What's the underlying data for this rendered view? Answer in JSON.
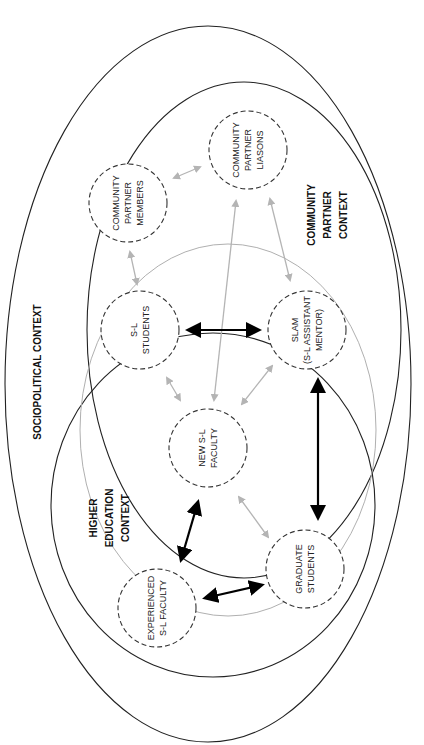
{
  "diagram": {
    "orientation": "rotated-90-clockwise",
    "colors": {
      "background": "#ffffff",
      "context_line": "#222222",
      "overlap_line": "#b0b0b0",
      "node_border": "#333333",
      "strong_arrow": "#000000",
      "weak_arrow": "#b4b4b4"
    },
    "contexts": {
      "sociopolitical": {
        "label": "SOCIOPOLITICAL CONTEXT"
      },
      "higher_education": {
        "lines": [
          "HIGHER",
          "EDUCATION",
          "CONTEXT"
        ]
      },
      "community_partner": {
        "lines": [
          "COMMUNITY",
          "PARTNER",
          "CONTEXT"
        ]
      }
    },
    "nodes": {
      "community_partner_members": {
        "lines": [
          "COMMUNITY",
          "PARTNER",
          "MEMBERS"
        ]
      },
      "community_partner_liasons": {
        "lines": [
          "COMMUNITY",
          "PARTNER",
          "LIASONS"
        ]
      },
      "sl_students": {
        "lines": [
          "S-L",
          "STUDENTS"
        ]
      },
      "slam": {
        "lines": [
          "SLAM",
          "(S-L ASSISTANT",
          "MENTOR)"
        ]
      },
      "new_sl_faculty": {
        "lines": [
          "NEW S-L",
          "FACULTY"
        ]
      },
      "experienced_sl_faculty": {
        "lines": [
          "EXPERIENCED",
          "S-L FACULTY"
        ]
      },
      "graduate_students": {
        "lines": [
          "GRADUATE",
          "STUDENTS"
        ]
      }
    },
    "connections": [
      {
        "from": "COMMUNITY PARTNER MEMBERS",
        "to": "COMMUNITY PARTNER LIASONS",
        "style": "weak",
        "direction": "both"
      },
      {
        "from": "COMMUNITY PARTNER MEMBERS",
        "to": "S-L STUDENTS",
        "style": "weak",
        "direction": "both"
      },
      {
        "from": "COMMUNITY PARTNER LIASONS",
        "to": "SLAM",
        "style": "weak",
        "direction": "both"
      },
      {
        "from": "COMMUNITY PARTNER LIASONS",
        "to": "NEW S-L FACULTY",
        "style": "weak",
        "direction": "both"
      },
      {
        "from": "S-L STUDENTS",
        "to": "SLAM",
        "style": "strong",
        "direction": "both"
      },
      {
        "from": "S-L STUDENTS",
        "to": "NEW S-L FACULTY",
        "style": "weak",
        "direction": "both"
      },
      {
        "from": "SLAM",
        "to": "NEW S-L FACULTY",
        "style": "weak",
        "direction": "both"
      },
      {
        "from": "SLAM",
        "to": "GRADUATE STUDENTS",
        "style": "strong",
        "direction": "both"
      },
      {
        "from": "NEW S-L FACULTY",
        "to": "EXPERIENCED S-L FACULTY",
        "style": "strong",
        "direction": "both"
      },
      {
        "from": "NEW S-L FACULTY",
        "to": "GRADUATE STUDENTS",
        "style": "weak",
        "direction": "both"
      },
      {
        "from": "EXPERIENCED S-L FACULTY",
        "to": "GRADUATE STUDENTS",
        "style": "strong",
        "direction": "both"
      }
    ]
  }
}
